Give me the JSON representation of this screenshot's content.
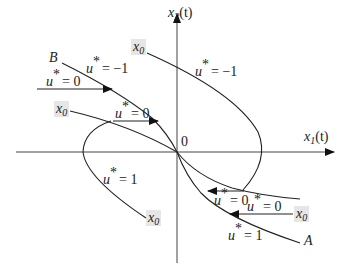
{
  "diagram": {
    "type": "phase-plane",
    "axes": {
      "x_label": "x",
      "x_label_sub": "1",
      "x_label_arg": "(t)",
      "y_label": "x",
      "y_label_sub": "2",
      "y_label_arg": "(t)",
      "origin_label": "0"
    },
    "curve_labels": {
      "B": "B",
      "A": "A"
    },
    "control_labels": [
      {
        "id": "u-top-right",
        "u": "u",
        "text": "= −1"
      },
      {
        "id": "u-B",
        "u": "u",
        "text": "= −1"
      },
      {
        "id": "u0-left-arrow",
        "u": "u",
        "text": "= 0"
      },
      {
        "id": "u0-mid-arrow",
        "u": "u",
        "text": "= 0"
      },
      {
        "id": "u1-left-loop",
        "u": "u",
        "text": "= 1"
      },
      {
        "id": "u0-lower-1",
        "u": "u",
        "text": "= 0"
      },
      {
        "id": "u0-lower-2",
        "u": "u",
        "text": "= 0"
      },
      {
        "id": "u1-lower",
        "u": "u",
        "text": "= 1"
      }
    ],
    "star": "*",
    "initial_state_label": "x",
    "initial_state_sub": "0",
    "colors": {
      "stroke": "#222222",
      "label_box": "#e6e6e6",
      "background": "#ffffff"
    }
  }
}
